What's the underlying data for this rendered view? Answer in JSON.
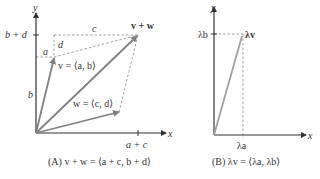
{
  "panelA": {
    "axis_x": "x",
    "axis_y": "y",
    "tick_y": "b + d",
    "tick_x": "a + c",
    "label_a": "a",
    "label_b": "b",
    "label_c": "c",
    "label_d": "d",
    "vec_v": "v = ⟨a, b⟩",
    "vec_w": "w = ⟨c, d⟩",
    "vec_sum": "v + w",
    "caption": "(A) v + w = ⟨a + c, b + d⟩"
  },
  "panelB": {
    "axis_x": "x",
    "axis_y": "y",
    "tick_y": "λb",
    "tick_x": "λa",
    "vec": "λv",
    "caption": "(B) λv = ⟨λa, λb⟩"
  },
  "colors": {
    "vector": "#808080",
    "axis": "#333333",
    "dashed": "#777777",
    "lambda_vector": "#a0a0a0"
  }
}
